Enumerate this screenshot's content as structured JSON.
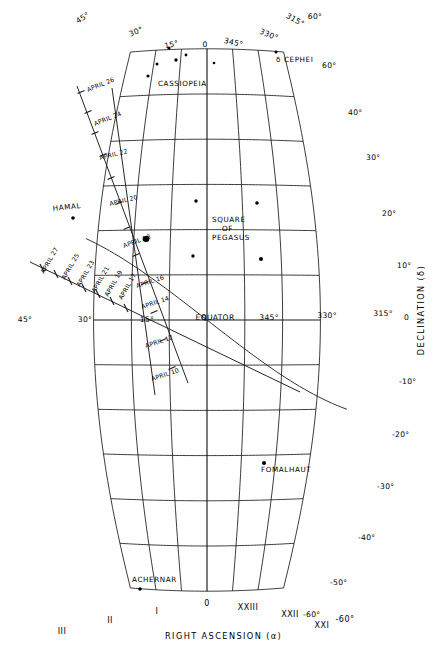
{
  "chart": {
    "title_axis_x": "RIGHT ASCENSION  (α)",
    "title_axis_y": "DECLINATION  (δ)",
    "equator_label": "EQUATOR",
    "type": "star-chart"
  },
  "chart_data": {
    "type": "scatter",
    "title": "",
    "xlabel": "RIGHT ASCENSION  (α)",
    "ylabel": "DECLINATION  (δ)",
    "projection": "sinusoidal-style equatorial star chart",
    "grid": true,
    "xlim": [
      315,
      45
    ],
    "ylim": [
      -60,
      60
    ],
    "x_tick_labels_top": [
      "45°",
      "30°",
      "15°",
      "0",
      "345°",
      "330°",
      "315°"
    ],
    "x_tick_labels_equator": [
      "45°",
      "30°",
      "15°",
      "0",
      "345°",
      "330°",
      "315°"
    ],
    "x_tick_labels_bottom_ra_hours": [
      "III",
      "II",
      "I",
      "0",
      "XXIII",
      "XXII",
      "XXI"
    ],
    "y_tick_labels_right": [
      "60°",
      "40°",
      "30°",
      "20°",
      "10°",
      "0",
      "-10°",
      "-20°",
      "-30°",
      "-40°",
      "-50°",
      "-60°"
    ],
    "corner_labels": [
      "60°",
      "60°",
      "-60°",
      "-60°"
    ],
    "objects": [
      {
        "name": "CASSIOPEIA",
        "type": "constellation",
        "ra_deg": 8,
        "dec_deg": 57,
        "stars": 5
      },
      {
        "name": "δ CEPHEI",
        "type": "star",
        "ra_deg": 337,
        "dec_deg": 58
      },
      {
        "name": "SQUARE OF PEGASUS",
        "type": "asterism",
        "ra_deg": 354,
        "dec_deg": 18,
        "stars": 4
      },
      {
        "name": "HAMAL",
        "type": "star",
        "ra_deg": 31,
        "dec_deg": 23
      },
      {
        "name": "FOMALHAUT",
        "type": "star",
        "ra_deg": 345,
        "dec_deg": -30
      },
      {
        "name": "ACHERNAR",
        "type": "star",
        "ra_deg": 25,
        "dec_deg": -57
      }
    ],
    "date_track_primary": [
      "APRIL 26",
      "APRIL 24",
      "APRIL 22",
      "APRIL 20",
      "APRIL 18",
      "APRIL 16",
      "APRIL 14",
      "APRIL 12",
      "APRIL 10"
    ],
    "date_track_secondary": [
      "APRIL 27",
      "APRIL 25",
      "APRIL 23",
      "APRIL 21",
      "APRIL 19",
      "APRIL 17"
    ]
  },
  "labels": {
    "top_degrees": [
      {
        "text": "45°",
        "x": 84,
        "y": 20,
        "rot": -32
      },
      {
        "text": "30°",
        "x": 137,
        "y": 34,
        "rot": -22
      },
      {
        "text": "15°",
        "x": 172,
        "y": 47,
        "rot": -13
      },
      {
        "text": "0",
        "x": 205,
        "y": 47,
        "rot": 0
      },
      {
        "text": "345°",
        "x": 233,
        "y": 45,
        "rot": 13
      },
      {
        "text": "330°",
        "x": 268,
        "y": 37,
        "rot": 22
      },
      {
        "text": "315°",
        "x": 294,
        "y": 22,
        "rot": 30
      },
      {
        "text": "60°",
        "x": 315,
        "y": 19,
        "rot": 0
      }
    ],
    "equator_degrees": [
      {
        "text": "45°",
        "x": 25,
        "y": 322
      },
      {
        "text": "30°",
        "x": 85,
        "y": 322
      },
      {
        "text": "15°",
        "x": 147,
        "y": 322
      },
      {
        "text": "0",
        "x": 204,
        "y": 320
      },
      {
        "text": "EQUATOR",
        "x": 215,
        "y": 320
      },
      {
        "text": "345°",
        "x": 269,
        "y": 320
      },
      {
        "text": "330°",
        "x": 327,
        "y": 318
      },
      {
        "text": "315°",
        "x": 383,
        "y": 316
      }
    ],
    "right_declinations": [
      {
        "text": "60°",
        "x": 322,
        "y": 68
      },
      {
        "text": "40°",
        "x": 348,
        "y": 115
      },
      {
        "text": "30°",
        "x": 366,
        "y": 160
      },
      {
        "text": "20°",
        "x": 382,
        "y": 216
      },
      {
        "text": "10°",
        "x": 397,
        "y": 268
      },
      {
        "text": "0",
        "x": 404,
        "y": 320
      },
      {
        "text": "-10°",
        "x": 399,
        "y": 384
      },
      {
        "text": "-20°",
        "x": 392,
        "y": 437
      },
      {
        "text": "-30°",
        "x": 377,
        "y": 489
      },
      {
        "text": "-40°",
        "x": 358,
        "y": 540
      },
      {
        "text": "-50°",
        "x": 330,
        "y": 585
      },
      {
        "text": "-60°",
        "x": 303,
        "y": 617
      }
    ],
    "bottom_ra": [
      {
        "text": "III",
        "x": 62,
        "y": 634
      },
      {
        "text": "II",
        "x": 110,
        "y": 623
      },
      {
        "text": "I",
        "x": 157,
        "y": 614
      },
      {
        "text": "0",
        "x": 207,
        "y": 606
      },
      {
        "text": "XXIII",
        "x": 248,
        "y": 610
      },
      {
        "text": "XXII",
        "x": 290,
        "y": 617
      },
      {
        "text": "XXI",
        "x": 322,
        "y": 628
      },
      {
        "text": "-60°",
        "x": 345,
        "y": 622
      }
    ],
    "axis_x": {
      "text": "RIGHT ASCENSION  (α)",
      "x": 165,
      "y": 639
    },
    "axis_y": {
      "text": "DECLINATION  (δ)",
      "x": 424,
      "y": 310
    },
    "objects": [
      {
        "text": "CASSIOPEIA",
        "x": 158,
        "y": 86,
        "rot": 0
      },
      {
        "text": "δ CEPHEI",
        "x": 276,
        "y": 62,
        "rot": 0
      },
      {
        "text": "SQUARE",
        "x": 212,
        "y": 222,
        "rot": 0
      },
      {
        "text": "OF",
        "x": 222,
        "y": 231,
        "rot": 0
      },
      {
        "text": "PEGASUS",
        "x": 212,
        "y": 240,
        "rot": 0
      },
      {
        "text": "HAMAL",
        "x": 53,
        "y": 211,
        "rot": -6
      },
      {
        "text": "FOMALHAUT",
        "x": 261,
        "y": 472,
        "rot": 0
      },
      {
        "text": "ACHERNAR",
        "x": 132,
        "y": 582,
        "rot": 0
      }
    ],
    "dates_primary": [
      {
        "text": "APRIL 26",
        "x": 88,
        "y": 92,
        "rot": -22
      },
      {
        "text": "APRIL 24",
        "x": 95,
        "y": 126,
        "rot": -22
      },
      {
        "text": "APRIL 22",
        "x": 100,
        "y": 160,
        "rot": -14
      },
      {
        "text": "APRIL 20",
        "x": 110,
        "y": 206,
        "rot": -14
      },
      {
        "text": "APRIL 18",
        "x": 124,
        "y": 248,
        "rot": -20
      },
      {
        "text": "APRIL 16",
        "x": 137,
        "y": 288,
        "rot": -18
      },
      {
        "text": "APRIL 14",
        "x": 142,
        "y": 309,
        "rot": -18
      },
      {
        "text": "APRIL 12",
        "x": 146,
        "y": 348,
        "rot": -18
      },
      {
        "text": "APRIL 10",
        "x": 152,
        "y": 381,
        "rot": -18
      }
    ],
    "dates_secondary": [
      {
        "text": "APRIL 27",
        "x": 44,
        "y": 274,
        "rot": -60
      },
      {
        "text": "APRIL 25",
        "x": 65,
        "y": 280,
        "rot": -60
      },
      {
        "text": "APRIL 23",
        "x": 80,
        "y": 287,
        "rot": -60
      },
      {
        "text": "APRIL 21",
        "x": 95,
        "y": 293,
        "rot": -60
      },
      {
        "text": "APRIL 19",
        "x": 108,
        "y": 297,
        "rot": -60
      },
      {
        "text": "APRIL 17",
        "x": 122,
        "y": 300,
        "rot": -60
      }
    ]
  }
}
